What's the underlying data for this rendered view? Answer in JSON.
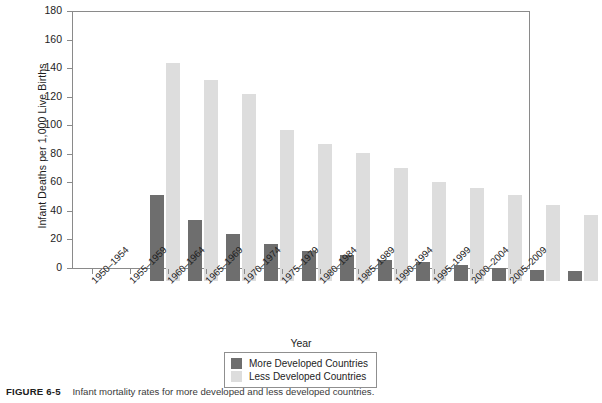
{
  "chart_data": {
    "type": "bar",
    "title": "",
    "xlabel": "Year",
    "ylabel": "Infant Deaths per 1,000 Live Births",
    "ylim": [
      0,
      180
    ],
    "yticks": [
      0,
      20,
      40,
      60,
      80,
      100,
      120,
      140,
      160,
      180
    ],
    "grid": false,
    "legend_position": "bottom-center",
    "categories": [
      "1950–1954",
      "1955–1959",
      "1960–1964",
      "1965–1969",
      "1970–1974",
      "1975–1979",
      "1980–1984",
      "1985–1989",
      "1990–1994",
      "1995–1999",
      "2000–2004",
      "2005–2009"
    ],
    "series": [
      {
        "name": "More Developed Countries",
        "color": "#6e6e6e",
        "values": [
          60,
          43,
          33,
          26,
          21,
          18,
          15,
          13,
          11,
          9,
          8,
          7
        ]
      },
      {
        "name": "Less Developed Countries",
        "color": "#dddddd",
        "values": [
          153,
          141,
          131,
          106,
          96,
          90,
          79,
          69,
          65,
          60,
          53,
          46
        ]
      }
    ]
  },
  "legend": {
    "items": [
      {
        "label": "More Developed Countries",
        "swatch": "dark"
      },
      {
        "label": "Less Developed Countries",
        "swatch": "light"
      }
    ]
  },
  "caption": {
    "figure_number": "FIGURE 6-5",
    "text": "Infant mortality rates for more developed and less developed countries."
  },
  "colors": {
    "more_developed": "#6e6e6e",
    "less_developed": "#dddddd",
    "axis": "#8a8a8a",
    "text": "#1d1d1d"
  }
}
